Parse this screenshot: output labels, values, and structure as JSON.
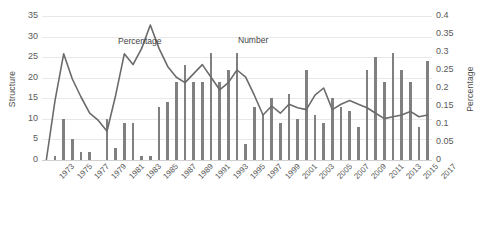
{
  "chart_data": {
    "type": "bar",
    "title": "",
    "subtitle": "",
    "xlabel": "",
    "ylabel": "Structure",
    "y2label": "Percentage",
    "ylim": [
      0,
      35
    ],
    "y2lim": [
      0,
      0.4
    ],
    "yticks": [
      "0",
      "5",
      "10",
      "15",
      "20",
      "25",
      "30",
      "35"
    ],
    "y2ticks": [
      "0",
      "0.05",
      "0.1",
      "0.15",
      "0.2",
      "0.25",
      "0.3",
      "0.35",
      "0.4"
    ],
    "grid": true,
    "legend_position": "inline-annotations",
    "annotations": [
      {
        "text": "Percentage",
        "series": "Percentage",
        "x": 1981
      },
      {
        "text": "Number",
        "series": "Number",
        "x": 1994
      }
    ],
    "x": [
      1973,
      1974,
      1975,
      1976,
      1977,
      1978,
      1979,
      1980,
      1981,
      1982,
      1983,
      1984,
      1985,
      1986,
      1987,
      1988,
      1989,
      1990,
      1991,
      1992,
      1993,
      1994,
      1995,
      1996,
      1997,
      1998,
      1999,
      2000,
      2001,
      2002,
      2003,
      2004,
      2005,
      2006,
      2007,
      2008,
      2009,
      2010,
      2011,
      2012,
      2013,
      2014,
      2015,
      2016,
      2017
    ],
    "xtick_labels": [
      "1973",
      "1975",
      "1977",
      "1979",
      "1981",
      "1983",
      "1985",
      "1987",
      "1989",
      "1991",
      "1993",
      "1995",
      "1997",
      "1999",
      "2001",
      "2003",
      "2005",
      "2007",
      "2009",
      "2011",
      "2013",
      "2015",
      "2017"
    ],
    "series": [
      {
        "name": "Number",
        "kind": "bar",
        "axis": "left",
        "color": "#808080",
        "values": [
          0,
          1,
          10,
          5,
          2,
          2,
          0,
          10,
          3,
          9,
          9,
          1,
          1,
          13,
          14,
          19,
          23,
          19,
          19,
          26,
          19,
          22,
          26,
          4,
          13,
          11,
          15,
          9,
          16,
          10,
          22,
          11,
          9,
          15,
          13,
          12,
          8,
          22,
          25,
          19,
          26,
          22,
          19,
          8,
          24
        ]
      },
      {
        "name": "Percentage",
        "kind": "line",
        "axis": "right",
        "color": "#6b6b6b",
        "values": [
          0.0,
          0.165,
          0.295,
          0.225,
          0.175,
          0.13,
          0.11,
          0.08,
          0.18,
          0.295,
          0.265,
          0.31,
          0.375,
          0.31,
          0.26,
          0.23,
          0.215,
          0.24,
          0.265,
          0.23,
          0.195,
          0.215,
          0.25,
          0.23,
          0.18,
          0.125,
          0.15,
          0.13,
          0.155,
          0.145,
          0.14,
          0.18,
          0.2,
          0.14,
          0.155,
          0.165,
          0.155,
          0.145,
          0.13,
          0.115,
          0.12,
          0.125,
          0.135,
          0.12,
          0.125
        ]
      }
    ]
  }
}
